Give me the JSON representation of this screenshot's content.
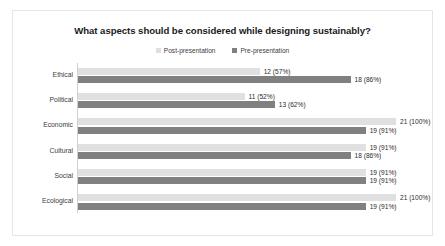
{
  "chart_data": {
    "type": "bar",
    "orientation": "horizontal",
    "title": "What aspects should be considered while designing sustainably?",
    "xlabel": "",
    "ylabel": "",
    "grid": false,
    "legend_position": "top-center",
    "xlim": [
      0,
      21
    ],
    "categories": [
      "Ethical",
      "Political",
      "Economic",
      "Cultural",
      "Social",
      "Ecological"
    ],
    "series": [
      {
        "name": "Post-presentation",
        "color": "#e0e0e0",
        "marker": "square",
        "values": [
          12,
          11,
          21,
          19,
          19,
          21
        ],
        "percents": [
          "57%",
          "52%",
          "100%",
          "91%",
          "91%",
          "100%"
        ],
        "labels": [
          "12 (57%)",
          "11 (52%)",
          "21 (100%)",
          "19 (91%)",
          "19 (91%)",
          "21 (100%)"
        ]
      },
      {
        "name": "Pre-presentation",
        "color": "#808080",
        "marker": "square",
        "values": [
          18,
          13,
          19,
          18,
          19,
          19
        ],
        "percents": [
          "86%",
          "62%",
          "91%",
          "86%",
          "91%",
          "91%"
        ],
        "labels": [
          "18 (86%)",
          "13 (62%)",
          "19 (91%)",
          "18 (86%)",
          "19 (91%)",
          "19 (91%)"
        ]
      }
    ]
  },
  "colors": {
    "post_presentation": "#e0e0e0",
    "pre_presentation": "#808080",
    "title_text": "#1a1a1a",
    "label_text": "#3d3d3d",
    "value_text": "#2b2b2b",
    "axis_line": "#d0d0d0",
    "frame_border": "#e6e6e6",
    "background": "#ffffff"
  }
}
